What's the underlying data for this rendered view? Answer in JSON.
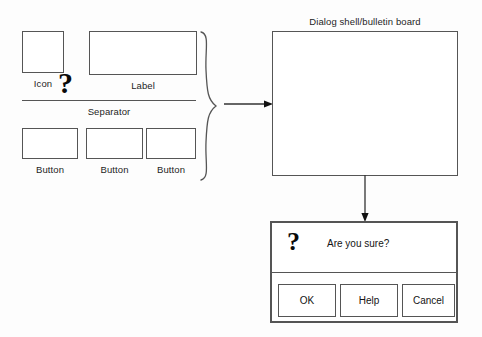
{
  "diagram": {
    "parts": {
      "icon": {
        "label": "Icon",
        "glyph": "?"
      },
      "label": {
        "label": "Label"
      },
      "separator": {
        "label": "Separator"
      },
      "buttons": [
        {
          "label": "Button"
        },
        {
          "label": "Button"
        },
        {
          "label": "Button"
        }
      ]
    },
    "shell": {
      "caption": "Dialog shell/bulletin board"
    },
    "dialog": {
      "glyph": "?",
      "message": "Are you sure?",
      "buttons": [
        {
          "label": "OK"
        },
        {
          "label": "Help"
        },
        {
          "label": "Cancel"
        }
      ]
    },
    "colors": {
      "stroke": "#555555",
      "background": "#fdfdfd",
      "text": "#141414"
    }
  }
}
